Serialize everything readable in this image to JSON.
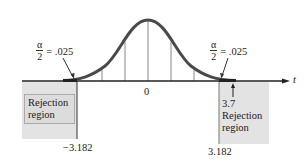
{
  "diagram": {
    "title": "",
    "axis_label": "t",
    "center_label": "0",
    "left_tail": {
      "alpha_fraction_numerator": "α",
      "alpha_fraction_denominator": "2",
      "alpha_value": "= .025",
      "critical_value": "−3.182",
      "region_label_line1": "Rejection",
      "region_label_line2": "region"
    },
    "right_tail": {
      "alpha_fraction_numerator": "α",
      "alpha_fraction_denominator": "2",
      "alpha_value": "= .025",
      "critical_value": "3.182",
      "test_statistic": "3.7",
      "region_label_line1": "Rejection",
      "region_label_line2": "region"
    },
    "colors": {
      "curve": "#4a4a4a",
      "axis": "#222222",
      "region_fill": "#dcdcdc",
      "grid_lines": "#888888"
    }
  }
}
